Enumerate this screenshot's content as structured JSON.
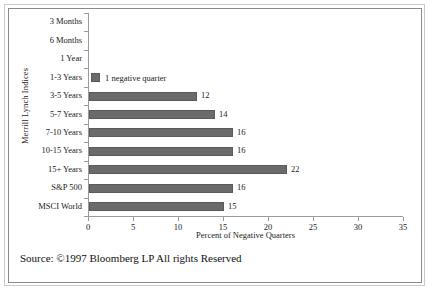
{
  "chart_data": {
    "type": "bar",
    "orientation": "horizontal",
    "title": "",
    "xlabel": "Percent of Negative Quarters",
    "ylabel": "Merrill Lynch Indices",
    "xlim": [
      0,
      35
    ],
    "xticks": [
      0,
      5,
      10,
      15,
      20,
      25,
      30,
      35
    ],
    "grid": false,
    "categories": [
      "3 Months",
      "6 Months",
      "1 Year",
      "1-3 Years",
      "3-5 Years",
      "5-7 Years",
      "7-10 Years",
      "10-15 Years",
      "15+ Years",
      "S&P 500",
      "MSCI World"
    ],
    "values": [
      0,
      0,
      0,
      0,
      12,
      14,
      16,
      16,
      22,
      16,
      15
    ],
    "value_labels": [
      "",
      "",
      "",
      "",
      "12",
      "14",
      "16",
      "16",
      "22",
      "16",
      "15"
    ],
    "legend": {
      "position": "inside-upper-left",
      "entries": [
        {
          "label": "1 negative quarter",
          "color": "#6b6b6b"
        }
      ]
    },
    "colors": {
      "bar": "#6b6b6b",
      "bar_edge": "#5a5a5a",
      "axis": "#9a9a9a",
      "text": "#1a1a1a",
      "background": "#ffffff"
    }
  },
  "footer": {
    "source": "Source: ©1997 Bloomberg LP All rights Reserved"
  }
}
